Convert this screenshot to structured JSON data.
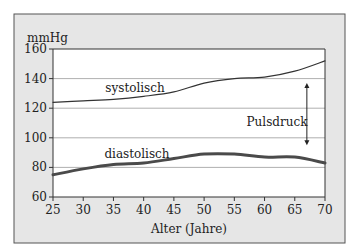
{
  "chart_data": {
    "type": "line",
    "title": "",
    "xlabel": "Alter (Jahre)",
    "ylabel": "mmHg",
    "xlim": [
      25,
      70
    ],
    "ylim": [
      60,
      160
    ],
    "x_ticks": [
      25,
      30,
      35,
      40,
      45,
      50,
      55,
      60,
      65,
      70
    ],
    "y_ticks": [
      60,
      80,
      100,
      120,
      140,
      160
    ],
    "grid": "horizontal",
    "legend": "inline labels",
    "x": [
      25,
      30,
      35,
      40,
      45,
      50,
      55,
      60,
      65,
      70
    ],
    "series": [
      {
        "name": "systolisch",
        "values": [
          124,
          125,
          126,
          128,
          131,
          137,
          140,
          141,
          145,
          152
        ],
        "color": "#333333",
        "width": 1.2
      },
      {
        "name": "diastolisch",
        "values": [
          75,
          79,
          82,
          83,
          86,
          89,
          89,
          87,
          87,
          83
        ],
        "color": "#4a4a4a",
        "width": 3
      }
    ],
    "annotations": [
      {
        "text": "Pulsdruck",
        "type": "double-arrow",
        "x_age": 67,
        "from": 137,
        "to": 95
      }
    ]
  },
  "labels": {
    "ylabel": "mmHg",
    "xlabel": "Alter (Jahre)",
    "systolic": "systolisch",
    "diastolic": "diastolisch",
    "pulse": "Pulsdruck"
  },
  "colors": {
    "frame_bg": "#e6e6e6",
    "plot_bg": "#ffffff",
    "grid": "#9a9a9a",
    "axis": "#333333"
  }
}
